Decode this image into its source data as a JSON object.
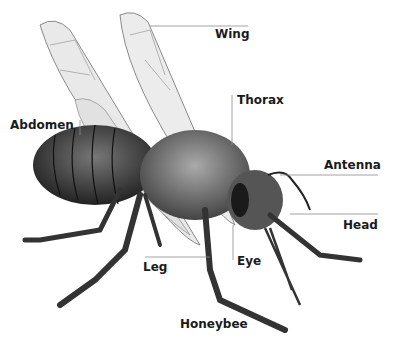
{
  "diagram": {
    "subject": "Honeybee",
    "title": "Honeybee",
    "labels": {
      "wing": "Wing",
      "thorax": "Thorax",
      "abdomen": "Abdomen",
      "antenna": "Antenna",
      "head": "Head",
      "leg": "Leg",
      "eye": "Eye"
    },
    "colors": {
      "background": "#ffffff",
      "text": "#1a1a1a",
      "leader_line": "#8a8a8a"
    }
  }
}
